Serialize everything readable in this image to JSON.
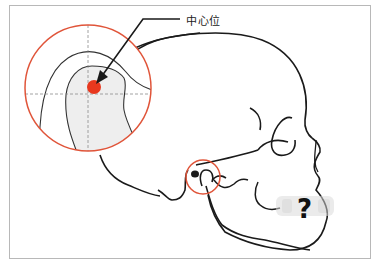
{
  "figure": {
    "callout_label": "中心位",
    "question_mark": "?"
  },
  "colors": {
    "frame_border": "#b8b8b8",
    "magnifier_circle": "#e0553a",
    "center_dot": "#e8381e",
    "outline": "#1a1a1a",
    "condyle_fill": "#eeeeee",
    "crosshair": "#8a8a8a"
  },
  "icons": {
    "arrow": "arrow-pointer-icon",
    "question": "question-mark-icon"
  }
}
